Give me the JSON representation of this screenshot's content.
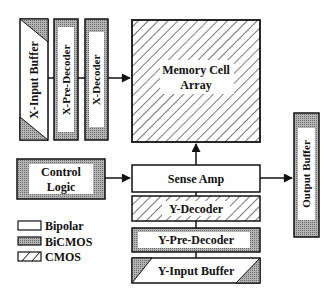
{
  "blocks": {
    "x_input_buffer": {
      "label": "X-Input Buffer",
      "tech": "CMOS/BiCMOS mixed"
    },
    "x_pre_decoder": {
      "label": "X-Pre-Decoder",
      "tech": "BiCMOS"
    },
    "x_decoder": {
      "label": "X-Decoder",
      "tech": "BiCMOS"
    },
    "memory_cell_array": {
      "label_line1": "Memory Cell",
      "label_line2": "Array",
      "tech": "CMOS"
    },
    "control_logic": {
      "label_line1": "Control",
      "label_line2": "Logic",
      "tech": "BiCMOS"
    },
    "sense_amp": {
      "label": "Sense Amp",
      "tech": "Bipolar"
    },
    "y_decoder": {
      "label": "Y-Decoder",
      "tech": "CMOS"
    },
    "y_pre_decoder": {
      "label": "Y-Pre-Decoder",
      "tech": "BiCMOS"
    },
    "y_input_buffer": {
      "label": "Y-Input Buffer",
      "tech": "CMOS/BiCMOS mixed"
    },
    "output_buffer": {
      "label": "Output Buffer",
      "tech": "BiCMOS"
    }
  },
  "legend": [
    {
      "label": "Bipolar",
      "pattern": "plain"
    },
    {
      "label": "BiCMOS",
      "pattern": "stipple"
    },
    {
      "label": "CMOS",
      "pattern": "hatch"
    }
  ],
  "colors": {
    "stroke": "#111111",
    "stipple": "#9a9a9a",
    "background": "#ffffff"
  }
}
